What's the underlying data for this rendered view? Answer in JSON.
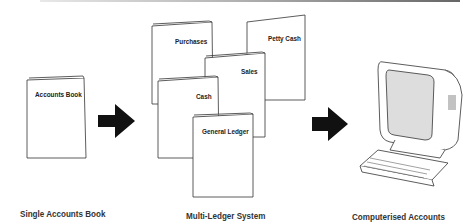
{
  "stages": [
    {
      "caption": "Single Accounts Book",
      "books": [
        "Accounts Book"
      ]
    },
    {
      "caption": "Multi-Ledger System",
      "books": [
        "Purchases",
        "Petty Cash",
        "Sales",
        "Cash",
        "General Ledger"
      ]
    },
    {
      "caption": "Computerised Accounts",
      "device": "computer-terminal"
    }
  ],
  "arrows": [
    "arrow-right",
    "arrow-right"
  ]
}
